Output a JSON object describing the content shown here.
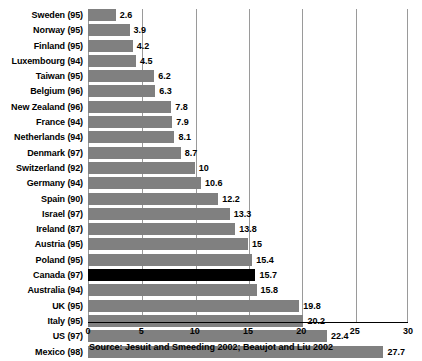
{
  "chart_data": {
    "type": "bar",
    "orientation": "horizontal",
    "title": "",
    "subtitle": "",
    "xlabel": "",
    "ylabel": "",
    "xlim": [
      0,
      30
    ],
    "xticks": [
      0,
      5,
      10,
      15,
      20,
      25,
      30
    ],
    "xtick_labels": [
      "0",
      "5",
      "10",
      "15",
      "20",
      "25",
      "30"
    ],
    "grid": true,
    "grid_axis": "x",
    "legend": false,
    "categories": [
      "Sweden (95)",
      "Norway (95)",
      "Finland (95)",
      "Luxembourg (94)",
      "Taiwan (95)",
      "Belgium (96)",
      "New Zealand (96)",
      "France (94)",
      "Netherlands (94)",
      "Denmark (97)",
      "Switzerland (92)",
      "Germany (94)",
      "Spain (90)",
      "Israel (97)",
      "Ireland (87)",
      "Austria (95)",
      "Poland (95)",
      "Canada (97)",
      "Australia (94)",
      "UK (95)",
      "Italy (95)",
      "US (97)",
      "Mexico (98)"
    ],
    "values": [
      2.6,
      3.9,
      4.2,
      4.5,
      6.2,
      6.3,
      7.8,
      7.9,
      8.1,
      8.7,
      10,
      10.6,
      12.2,
      13.3,
      13.8,
      15,
      15.4,
      15.7,
      15.8,
      19.8,
      20.2,
      22.4,
      27.7
    ],
    "value_labels": [
      "2.6",
      "3.9",
      "4.2",
      "4.5",
      "6.2",
      "6.3",
      "7.8",
      "7.9",
      "8.1",
      "8.7",
      "10",
      "10.6",
      "12.2",
      "13.3",
      "13.8",
      "15",
      "15.4",
      "15.7",
      "15.8",
      "19.8",
      "20.2",
      "22.4",
      "27.7"
    ],
    "highlight_category": "Canada (97)",
    "highlight_index": 17,
    "colors": {
      "bar": "#808080",
      "highlight_bar": "#000000",
      "gridline": "#9a9a9a",
      "axis": "#000000",
      "text": "#000000",
      "background": "#ffffff"
    },
    "annotations": {
      "source": "Source: Jesuit and Smeeding 2002; Beaujot and Liu 2002"
    }
  }
}
